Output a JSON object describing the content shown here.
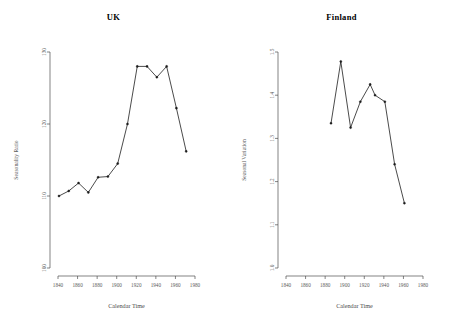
{
  "figure": {
    "background": "#ffffff",
    "line_color": "#2b2b2b",
    "axis_color": "#4d4d4d",
    "text_color": "#5a5a5a",
    "panel_count": 2
  },
  "panels": [
    {
      "key": "uk",
      "title": "UK"
    },
    {
      "key": "finland",
      "title": "Finland"
    }
  ],
  "chart_data": [
    {
      "type": "line",
      "title": "UK",
      "xlabel": "Calendar Time",
      "ylabel": "Seasonality Ratio",
      "xlim": [
        1840,
        1980
      ],
      "ylim": [
        100,
        130
      ],
      "xticks": [
        1840,
        1860,
        1880,
        1900,
        1920,
        1940,
        1960,
        1980
      ],
      "xticklabels": [
        "1840",
        "1860",
        "1880",
        "1900",
        "1920",
        "1940",
        "1960",
        "1980"
      ],
      "yticks": [
        100,
        110,
        120,
        130
      ],
      "yticklabels": [
        "100",
        "110",
        "120",
        "130"
      ],
      "grid": false,
      "legend": false,
      "markers": "filled-circle",
      "x": [
        1841,
        1851,
        1861,
        1871,
        1881,
        1891,
        1901,
        1911,
        1921,
        1931,
        1941,
        1951,
        1961,
        1971
      ],
      "values": [
        110.0,
        110.7,
        111.8,
        110.5,
        112.6,
        112.7,
        114.5,
        120.0,
        128.0,
        128.0,
        126.5,
        128.0,
        122.2,
        116.2
      ]
    },
    {
      "type": "line",
      "title": "Finland",
      "xlabel": "Calendar Time",
      "ylabel": "Seasonal Variation",
      "xlim": [
        1840,
        1980
      ],
      "ylim": [
        1.0,
        1.5
      ],
      "xticks": [
        1840,
        1860,
        1880,
        1900,
        1920,
        1940,
        1960,
        1980
      ],
      "xticklabels": [
        "1840",
        "1860",
        "1880",
        "1900",
        "1920",
        "1940",
        "1960",
        "1980"
      ],
      "yticks": [
        1.0,
        1.1,
        1.2,
        1.3,
        1.4,
        1.5
      ],
      "yticklabels": [
        "1.0",
        "1.1",
        "1.2",
        "1.3",
        "1.4",
        "1.5"
      ],
      "grid": false,
      "legend": false,
      "markers": "filled-circle",
      "x": [
        1886,
        1896,
        1906,
        1916,
        1926,
        1931,
        1941,
        1951,
        1961
      ],
      "values": [
        1.335,
        1.478,
        1.325,
        1.385,
        1.425,
        1.4,
        1.385,
        1.24,
        1.15
      ]
    }
  ]
}
